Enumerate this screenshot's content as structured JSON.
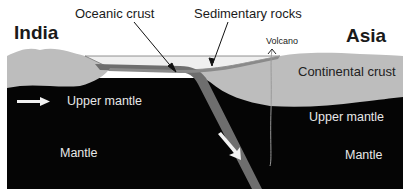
{
  "diagram": {
    "type": "subduction zone cross-section",
    "regions": {
      "left_plate": "India",
      "right_plate": "Asia"
    },
    "labels": {
      "oceanic_crust": "Oceanic crust",
      "sedimentary_rocks": "Sedimentary rocks",
      "volcano": "Volcano",
      "continental_crust": "Continental crust",
      "upper_mantle_left": "Upper mantle",
      "upper_mantle_right": "Upper mantle",
      "mantle_left": "Mantle",
      "mantle_right": "Mantle"
    },
    "colors": {
      "mantle": "#050505",
      "continental_crust": "#bdbdbd",
      "oceanic_crust": "#6e6e6e",
      "sediment": "#efefef",
      "arrow": "#f2f2f2",
      "background": "#ffffff"
    },
    "arrows": [
      {
        "name": "plate-motion-arrow",
        "direction": "right"
      },
      {
        "name": "subduction-arrow",
        "direction": "down-right"
      }
    ]
  }
}
